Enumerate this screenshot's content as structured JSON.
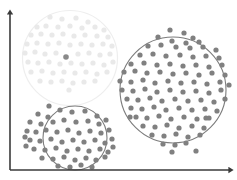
{
  "figure": {
    "title": "",
    "width": 237,
    "height": 180,
    "background_color": "#ffffff"
  },
  "axes": {
    "color": "#3a3a3a",
    "line_width": 1.6,
    "origin": [
      10,
      170
    ],
    "y_axis_top": [
      10,
      13
    ],
    "x_axis_right": [
      230,
      170
    ],
    "y_label": "",
    "x_label": "",
    "arrowheads": true,
    "ticks": false,
    "grid": false
  },
  "colors": {
    "faded_cluster_dot": "#e9e9e9",
    "faded_cluster_ring": "#eeeeee",
    "active_cluster_dot": "#808080",
    "active_cluster_ring": "#7c7c7c",
    "highlight_dot": "#8a8a8a",
    "axis": "#3a3a3a",
    "background": "#ffffff"
  },
  "chart_data": {
    "type": "scatter",
    "title": "",
    "xlabel": "",
    "ylabel": "",
    "xlim": [
      0,
      237
    ],
    "ylim": [
      0,
      180
    ],
    "grid": false,
    "legend": "none",
    "note": "Pixel coordinates, y increases downward as drawn on canvas.",
    "clusters": [
      {
        "name": "faded-cluster-top-left",
        "state": "faded",
        "dot_color": "#e9e9e9",
        "ring_color": "#eeeeee",
        "dot_radius": 2.6,
        "ring": {
          "cx": 70,
          "cy": 58,
          "r": 47.5,
          "stroke_width": 1.2
        },
        "point_count": 60,
        "points": [
          [
            50,
            17
          ],
          [
            62,
            19
          ],
          [
            76,
            18
          ],
          [
            88,
            22
          ],
          [
            37,
            27
          ],
          [
            46,
            26
          ],
          [
            58,
            27
          ],
          [
            70,
            26
          ],
          [
            82,
            28
          ],
          [
            95,
            27
          ],
          [
            104,
            30
          ],
          [
            31,
            35
          ],
          [
            41,
            34
          ],
          [
            52,
            35
          ],
          [
            63,
            34
          ],
          [
            74,
            36
          ],
          [
            85,
            35
          ],
          [
            97,
            36
          ],
          [
            108,
            37
          ],
          [
            27,
            44
          ],
          [
            37,
            43
          ],
          [
            48,
            44
          ],
          [
            59,
            43
          ],
          [
            70,
            45
          ],
          [
            81,
            44
          ],
          [
            92,
            45
          ],
          [
            103,
            44
          ],
          [
            112,
            46
          ],
          [
            25,
            53
          ],
          [
            35,
            52
          ],
          [
            45,
            54
          ],
          [
            56,
            53
          ],
          [
            78,
            54
          ],
          [
            89,
            53
          ],
          [
            100,
            55
          ],
          [
            110,
            54
          ],
          [
            28,
            62
          ],
          [
            38,
            63
          ],
          [
            49,
            62
          ],
          [
            60,
            64
          ],
          [
            71,
            63
          ],
          [
            82,
            64
          ],
          [
            93,
            63
          ],
          [
            104,
            65
          ],
          [
            113,
            62
          ],
          [
            31,
            72
          ],
          [
            42,
            71
          ],
          [
            53,
            73
          ],
          [
            64,
            72
          ],
          [
            75,
            73
          ],
          [
            86,
            72
          ],
          [
            97,
            74
          ],
          [
            107,
            72
          ],
          [
            40,
            81
          ],
          [
            51,
            82
          ],
          [
            62,
            81
          ],
          [
            73,
            83
          ],
          [
            84,
            82
          ],
          [
            95,
            81
          ],
          [
            69,
            90
          ]
        ],
        "highlight_point": {
          "x": 66,
          "y": 57,
          "color": "#8a8a8a",
          "radius": 2.8,
          "label": "centroid-marker"
        }
      },
      {
        "name": "active-cluster-bottom-left",
        "state": "active",
        "dot_color": "#808080",
        "ring_color": "#7c7c7c",
        "dot_radius": 2.6,
        "ring": {
          "cx": 75,
          "cy": 138,
          "r": 32,
          "stroke_width": 1.1
        },
        "point_count": 55,
        "points": [
          [
            60,
            110
          ],
          [
            72,
            112
          ],
          [
            85,
            111
          ],
          [
            97,
            116
          ],
          [
            38,
            114
          ],
          [
            48,
            117
          ],
          [
            30,
            122
          ],
          [
            41,
            124
          ],
          [
            53,
            122
          ],
          [
            64,
            120
          ],
          [
            76,
            122
          ],
          [
            88,
            121
          ],
          [
            99,
            124
          ],
          [
            106,
            120
          ],
          [
            27,
            131
          ],
          [
            36,
            132
          ],
          [
            46,
            130
          ],
          [
            57,
            132
          ],
          [
            68,
            130
          ],
          [
            79,
            133
          ],
          [
            90,
            131
          ],
          [
            101,
            133
          ],
          [
            109,
            130
          ],
          [
            30,
            140
          ],
          [
            40,
            141
          ],
          [
            51,
            139
          ],
          [
            62,
            142
          ],
          [
            73,
            140
          ],
          [
            84,
            142
          ],
          [
            95,
            140
          ],
          [
            105,
            143
          ],
          [
            112,
            139
          ],
          [
            34,
            149
          ],
          [
            45,
            150
          ],
          [
            56,
            148
          ],
          [
            67,
            151
          ],
          [
            78,
            149
          ],
          [
            89,
            151
          ],
          [
            100,
            149
          ],
          [
            108,
            152
          ],
          [
            42,
            158
          ],
          [
            53,
            159
          ],
          [
            64,
            157
          ],
          [
            75,
            160
          ],
          [
            86,
            158
          ],
          [
            96,
            160
          ],
          [
            105,
            157
          ],
          [
            58,
            166
          ],
          [
            70,
            167
          ],
          [
            81,
            165
          ],
          [
            92,
            167
          ],
          [
            26,
            146
          ],
          [
            25,
            137
          ],
          [
            113,
            147
          ],
          [
            49,
            106
          ]
        ]
      },
      {
        "name": "active-cluster-right",
        "state": "active",
        "dot_color": "#808080",
        "ring_color": "#7c7c7c",
        "dot_radius": 2.6,
        "ring": {
          "cx": 173,
          "cy": 90,
          "r": 53,
          "stroke_width": 1.1
        },
        "point_count": 98,
        "points": [
          [
            170,
            30
          ],
          [
            184,
            33
          ],
          [
            158,
            37
          ],
          [
            193,
            38
          ],
          [
            172,
            41
          ],
          [
            186,
            43
          ],
          [
            199,
            42
          ],
          [
            148,
            46
          ],
          [
            161,
            45
          ],
          [
            176,
            47
          ],
          [
            190,
            48
          ],
          [
            203,
            47
          ],
          [
            216,
            50
          ],
          [
            140,
            55
          ],
          [
            153,
            54
          ],
          [
            166,
            56
          ],
          [
            180,
            55
          ],
          [
            193,
            57
          ],
          [
            206,
            56
          ],
          [
            219,
            58
          ],
          [
            131,
            64
          ],
          [
            144,
            63
          ],
          [
            157,
            65
          ],
          [
            170,
            64
          ],
          [
            183,
            66
          ],
          [
            196,
            65
          ],
          [
            209,
            67
          ],
          [
            222,
            65
          ],
          [
            124,
            72
          ],
          [
            135,
            71
          ],
          [
            147,
            73
          ],
          [
            160,
            72
          ],
          [
            173,
            74
          ],
          [
            186,
            73
          ],
          [
            199,
            75
          ],
          [
            212,
            73
          ],
          [
            225,
            75
          ],
          [
            120,
            81
          ],
          [
            131,
            82
          ],
          [
            143,
            80
          ],
          [
            155,
            83
          ],
          [
            168,
            81
          ],
          [
            181,
            83
          ],
          [
            194,
            82
          ],
          [
            207,
            84
          ],
          [
            220,
            82
          ],
          [
            229,
            85
          ],
          [
            122,
            90
          ],
          [
            133,
            91
          ],
          [
            145,
            89
          ],
          [
            157,
            92
          ],
          [
            170,
            90
          ],
          [
            183,
            92
          ],
          [
            196,
            91
          ],
          [
            209,
            93
          ],
          [
            221,
            90
          ],
          [
            127,
            99
          ],
          [
            138,
            100
          ],
          [
            150,
            98
          ],
          [
            162,
            101
          ],
          [
            175,
            99
          ],
          [
            188,
            101
          ],
          [
            201,
            100
          ],
          [
            214,
            102
          ],
          [
            225,
            99
          ],
          [
            131,
            108
          ],
          [
            142,
            109
          ],
          [
            154,
            107
          ],
          [
            166,
            110
          ],
          [
            179,
            108
          ],
          [
            192,
            110
          ],
          [
            205,
            109
          ],
          [
            217,
            111
          ],
          [
            136,
            117
          ],
          [
            147,
            118
          ],
          [
            159,
            116
          ],
          [
            171,
            119
          ],
          [
            184,
            117
          ],
          [
            197,
            119
          ],
          [
            209,
            118
          ],
          [
            143,
            126
          ],
          [
            155,
            127
          ],
          [
            167,
            125
          ],
          [
            179,
            128
          ],
          [
            192,
            126
          ],
          [
            204,
            128
          ],
          [
            152,
            135
          ],
          [
            164,
            136
          ],
          [
            176,
            134
          ],
          [
            188,
            137
          ],
          [
            200,
            135
          ],
          [
            163,
            144
          ],
          [
            175,
            145
          ],
          [
            186,
            143
          ],
          [
            172,
            152
          ],
          [
            196,
            151
          ],
          [
            206,
            118
          ],
          [
            130,
            117
          ]
        ]
      }
    ]
  }
}
